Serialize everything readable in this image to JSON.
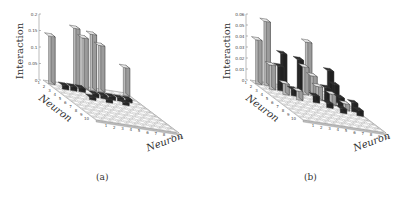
{
  "chart_data": [
    {
      "type": "bar3d",
      "panel": "a",
      "caption": "(a)",
      "zlabel": "Interaction",
      "xlabel": "Neuron",
      "ylabel": "Neuron",
      "x_ticks": [
        "1",
        "2",
        "3",
        "4",
        "5",
        "6",
        "7",
        "8",
        "9",
        "10"
      ],
      "y_ticks": [
        "1",
        "2",
        "3",
        "4",
        "5",
        "6",
        "7",
        "8",
        "9",
        "10"
      ],
      "z_ticks": [
        "0",
        "0.05",
        "0.1",
        "0.15",
        "0.2"
      ],
      "zlim": [
        0,
        0.2
      ],
      "colors": {
        "positive": "#cfcfcf",
        "negative": "#2a2a2a",
        "zero": "#ffffff"
      },
      "bars": [
        {
          "row": 1,
          "col": 1,
          "value": 0.145,
          "sign": "+"
        },
        {
          "row": 1,
          "col": 4,
          "value": 0.18,
          "sign": "+"
        },
        {
          "row": 1,
          "col": 5,
          "value": 0.155,
          "sign": "+"
        },
        {
          "row": 1,
          "col": 6,
          "value": 0.17,
          "sign": "+"
        },
        {
          "row": 1,
          "col": 7,
          "value": 0.14,
          "sign": "+"
        },
        {
          "row": 1,
          "col": 10,
          "value": 0.085,
          "sign": "+"
        },
        {
          "row": 2,
          "col": 2,
          "value": 0.012,
          "sign": "-"
        },
        {
          "row": 2,
          "col": 3,
          "value": 0.012,
          "sign": "-"
        },
        {
          "row": 2,
          "col": 4,
          "value": 0.012,
          "sign": "-"
        },
        {
          "row": 3,
          "col": 5,
          "value": 0.01,
          "sign": "-"
        },
        {
          "row": 3,
          "col": 6,
          "value": 0.01,
          "sign": "-"
        },
        {
          "row": 3,
          "col": 7,
          "value": 0.01,
          "sign": "-"
        },
        {
          "row": 3,
          "col": 8,
          "value": 0.01,
          "sign": "-"
        },
        {
          "row": 3,
          "col": 9,
          "value": 0.01,
          "sign": "-"
        },
        {
          "row": 4,
          "col": 4,
          "value": 0.008,
          "sign": "-"
        },
        {
          "row": 4,
          "col": 6,
          "value": 0.008,
          "sign": "-"
        },
        {
          "row": 4,
          "col": 8,
          "value": 0.008,
          "sign": "-"
        }
      ]
    },
    {
      "type": "bar3d",
      "panel": "b",
      "caption": "(b)",
      "zlabel": "Interaction",
      "xlabel": "Neuron",
      "ylabel": "Neuron",
      "x_ticks": [
        "1",
        "2",
        "3",
        "4",
        "5",
        "6",
        "7",
        "8",
        "9",
        "10"
      ],
      "y_ticks": [
        "1",
        "2",
        "3",
        "4",
        "5",
        "6",
        "7",
        "8",
        "9",
        "10"
      ],
      "z_ticks": [
        "0",
        "0.01",
        "0.02",
        "0.03",
        "0.04",
        "0.05",
        "0.06"
      ],
      "zlim": [
        0,
        0.06
      ],
      "colors": {
        "positive": "#cfcfcf",
        "negative": "#2a2a2a",
        "zero": "#ffffff"
      },
      "bars": [
        {
          "row": 1,
          "col": 1,
          "value": 0.04,
          "sign": "+"
        },
        {
          "row": 1,
          "col": 2,
          "value": 0.058,
          "sign": "+"
        },
        {
          "row": 2,
          "col": 2,
          "value": 0.022,
          "sign": "+"
        },
        {
          "row": 1,
          "col": 4,
          "value": 0.031,
          "sign": "-"
        },
        {
          "row": 2,
          "col": 3,
          "value": 0.022,
          "sign": "-"
        },
        {
          "row": 1,
          "col": 6,
          "value": 0.028,
          "sign": "-"
        },
        {
          "row": 1,
          "col": 7,
          "value": 0.045,
          "sign": "+"
        },
        {
          "row": 2,
          "col": 6,
          "value": 0.025,
          "sign": "+"
        },
        {
          "row": 2,
          "col": 7,
          "value": 0.018,
          "sign": "+"
        },
        {
          "row": 2,
          "col": 9,
          "value": 0.025,
          "sign": "-"
        },
        {
          "row": 3,
          "col": 3,
          "value": 0.01,
          "sign": "+"
        },
        {
          "row": 3,
          "col": 4,
          "value": 0.006,
          "sign": "-"
        },
        {
          "row": 3,
          "col": 7,
          "value": 0.012,
          "sign": "+"
        },
        {
          "row": 3,
          "col": 8,
          "value": 0.012,
          "sign": "-"
        },
        {
          "row": 3,
          "col": 9,
          "value": 0.016,
          "sign": "-"
        },
        {
          "row": 4,
          "col": 4,
          "value": 0.008,
          "sign": "+"
        },
        {
          "row": 4,
          "col": 6,
          "value": 0.006,
          "sign": "-"
        },
        {
          "row": 4,
          "col": 8,
          "value": 0.01,
          "sign": "+"
        },
        {
          "row": 4,
          "col": 9,
          "value": 0.008,
          "sign": "-"
        },
        {
          "row": 5,
          "col": 7,
          "value": 0.004,
          "sign": "-"
        },
        {
          "row": 5,
          "col": 9,
          "value": 0.006,
          "sign": "+"
        },
        {
          "row": 5,
          "col": 10,
          "value": 0.008,
          "sign": "-"
        },
        {
          "row": 6,
          "col": 10,
          "value": 0.005,
          "sign": "-"
        },
        {
          "row": 6,
          "col": 8,
          "value": 0.004,
          "sign": "-"
        }
      ]
    }
  ]
}
